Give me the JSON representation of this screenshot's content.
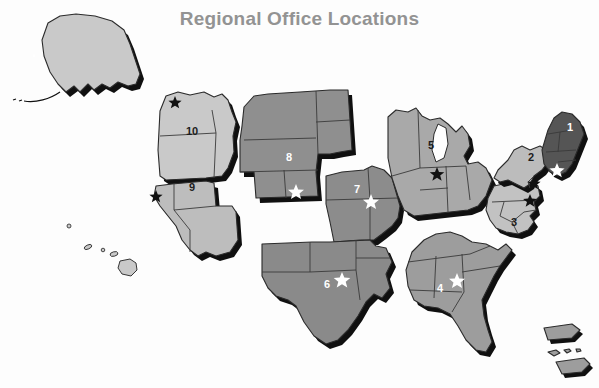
{
  "page": {
    "title": "Regional Office Locations",
    "background_color": "#fdfdfd",
    "title_color": "#939393",
    "width": 599,
    "height": 388
  },
  "map": {
    "name": "united-states-regions-map",
    "projection_note": "Continental US with Alaska, Hawaii and Puerto Rico insets",
    "colors": {
      "region_darkest": "#555555",
      "region_dark": "#7e7e7e",
      "region_medium": "#8c8c8c",
      "region_light_medium": "#9d9d9d",
      "region_light": "#bcbcbc",
      "region_lightest": "#c9c9c9",
      "outline": "#2b2b2b",
      "state_border": "#3a3a3a",
      "shadow": "#101010",
      "star_dark": "#111111",
      "star_light": "#ffffff"
    },
    "regions": [
      {
        "id": "region-1",
        "label": "1",
        "label_color": "light",
        "fill": "#555555",
        "star_color": "light",
        "name": "new-england"
      },
      {
        "id": "region-2",
        "label": "2",
        "label_color": "dark",
        "fill": "#bcbcbc",
        "star_color": "dark",
        "name": "new-york-new-jersey"
      },
      {
        "id": "region-3",
        "label": "3",
        "label_color": "dark",
        "fill": "#c2c2c2",
        "star_color": "dark",
        "name": "mid-atlantic"
      },
      {
        "id": "region-4",
        "label": "4",
        "label_color": "light",
        "fill": "#9d9d9d",
        "star_color": "light",
        "name": "southeast"
      },
      {
        "id": "region-5",
        "label": "5",
        "label_color": "dark",
        "fill": "#a9a9a9",
        "star_color": "dark",
        "name": "great-lakes"
      },
      {
        "id": "region-6",
        "label": "6",
        "label_color": "light",
        "fill": "#8a8a8a",
        "star_color": "light",
        "name": "south-central"
      },
      {
        "id": "region-7",
        "label": "7",
        "label_color": "light",
        "fill": "#8c8c8c",
        "star_color": "light",
        "name": "central-plains"
      },
      {
        "id": "region-8",
        "label": "8",
        "label_color": "light",
        "fill": "#8f8f8f",
        "star_color": "light",
        "name": "mountain"
      },
      {
        "id": "region-9",
        "label": "9",
        "label_color": "dark",
        "fill": "#bdbdbd",
        "star_color": "dark",
        "name": "pacific-southwest"
      },
      {
        "id": "region-10",
        "label": "10",
        "label_color": "dark",
        "fill": "#c9c9c9",
        "star_color": "dark",
        "name": "pacific-northwest"
      }
    ],
    "insets": [
      {
        "id": "alaska",
        "name": "alaska",
        "fill": "#c9c9c9"
      },
      {
        "id": "hawaii",
        "name": "hawaii",
        "fill": "#c9c9c9"
      },
      {
        "id": "puerto-rico",
        "name": "puerto-rico",
        "fill": "#9d9d9d"
      }
    ]
  }
}
